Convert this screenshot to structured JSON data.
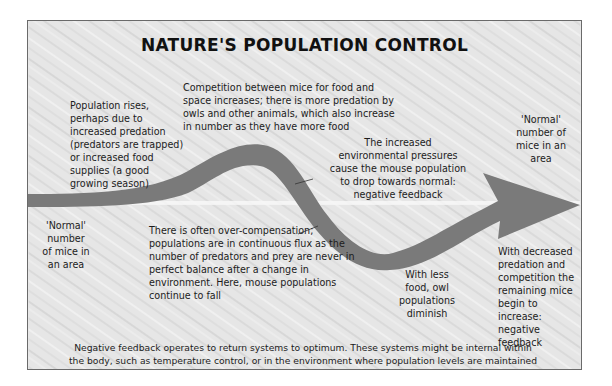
{
  "title": "NATURE'S POPULATION CONTROL",
  "labels": {
    "normal_left": "'Normal' number of mice in an area",
    "population_rises": "Population rises, perhaps due to increased predation (predators are trapped) or increased food supplies (a good growing season)",
    "competition": "Competition between mice for food and space increases; there is more predation by owls and other animals, which also increase in number as they have more food",
    "environmental_pressures": "The increased environmental pressures cause the mouse population to drop towards normal: negative feedback",
    "normal_right": "'Normal' number of mice in an area",
    "over_compensation": "There is often over-compensation; populations are in continuous flux as the number of predators and prey are never in perfect balance after a change in environment. Here, mouse populations continue to fall",
    "owl_diminish": "With less food, owl populations diminish",
    "decreased_predation": "With decreased predation and competition the remaining mice begin to increase: negative feedback"
  },
  "footer": "Negative feedback operates to return systems to optimum. These systems might be internal within the body, such as temperature control, or in the environment where population levels are maintained",
  "colors": {
    "arrow": "#7a7a7a",
    "baseline": "#f7f7f7",
    "background": "#e9e9e9",
    "frame_border": "#6a6a6a"
  }
}
